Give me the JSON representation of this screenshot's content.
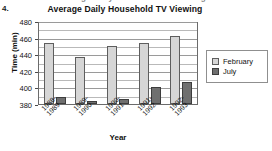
{
  "item_number": "4.",
  "cropped_header_text": "Average Daily Household TV Viewing",
  "axis": {
    "y_label": "Time (min)",
    "x_label": "Year",
    "y_ticks": [
      "380",
      "400",
      "420",
      "440",
      "460",
      "480"
    ]
  },
  "legend": {
    "items": [
      {
        "label": "February",
        "color": "#d6d6d6",
        "swatch_name": "legend-swatch-february"
      },
      {
        "label": "July",
        "color": "#6f6f6f",
        "swatch_name": "legend-swatch-july"
      }
    ]
  },
  "chart_data": {
    "type": "bar",
    "title": "Average Daily Household TV Viewing",
    "xlabel": "Year",
    "ylabel": "Time (min)",
    "ylim": [
      380,
      480
    ],
    "ytick_step": 20,
    "minor_gridline_step": 10,
    "grid": true,
    "legend_position": "right",
    "categories": [
      "1988-\n1989",
      "1989-\n1990",
      "1990-\n1991",
      "1991-\n1992",
      "1992-\n1993"
    ],
    "category_labels_flat": [
      "1988-1989",
      "1989-1990",
      "1990-1991",
      "1991-1992",
      "1992-1993"
    ],
    "series": [
      {
        "name": "February",
        "color": "#d6d6d6",
        "values": [
          453,
          437,
          450,
          454,
          462
        ]
      },
      {
        "name": "July",
        "color": "#6f6f6f",
        "values": [
          389,
          384,
          386,
          400,
          406
        ]
      }
    ]
  }
}
